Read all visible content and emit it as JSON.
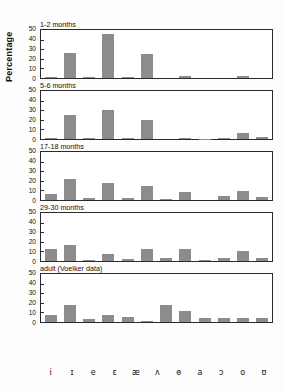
{
  "chart_data": {
    "type": "bar",
    "title": "",
    "xlabel": "",
    "ylabel": "Percentage",
    "ylim": [
      0,
      50
    ],
    "yticks": [
      0,
      10,
      20,
      30,
      40,
      50
    ],
    "grid": false,
    "legend": "none",
    "categories": [
      "i",
      "ɪ",
      "e",
      "ɛ",
      "æ",
      "ʌ",
      "ɵ",
      "a",
      "ɔ",
      "o",
      "ʊ",
      "u"
    ],
    "panels": [
      {
        "label": "1-2 months",
        "values": [
          1,
          26,
          1,
          46,
          1.5,
          25,
          0,
          2,
          0,
          0,
          2,
          0
        ]
      },
      {
        "label": "5-6 months",
        "values": [
          1,
          25,
          1.5,
          30,
          1.5,
          20,
          0,
          1,
          0.5,
          1,
          6,
          2
        ]
      },
      {
        "label": "17-18 months",
        "values": [
          6,
          22,
          2,
          18,
          2,
          15,
          1,
          8,
          0,
          4,
          9,
          3
        ]
      },
      {
        "label": "29-30 months",
        "values": [
          12,
          17,
          1,
          7,
          2,
          13,
          3,
          13,
          1,
          3,
          10,
          3
        ]
      },
      {
        "label": "adult (Voelker data)",
        "values": [
          7,
          18,
          3,
          7,
          5,
          1,
          18,
          11,
          4,
          4,
          4,
          4
        ]
      }
    ]
  },
  "colors": {
    "bar": "#8c8c8c",
    "axis": "#2a2a2a",
    "text": "#111111",
    "background": "#fdfdfd"
  }
}
